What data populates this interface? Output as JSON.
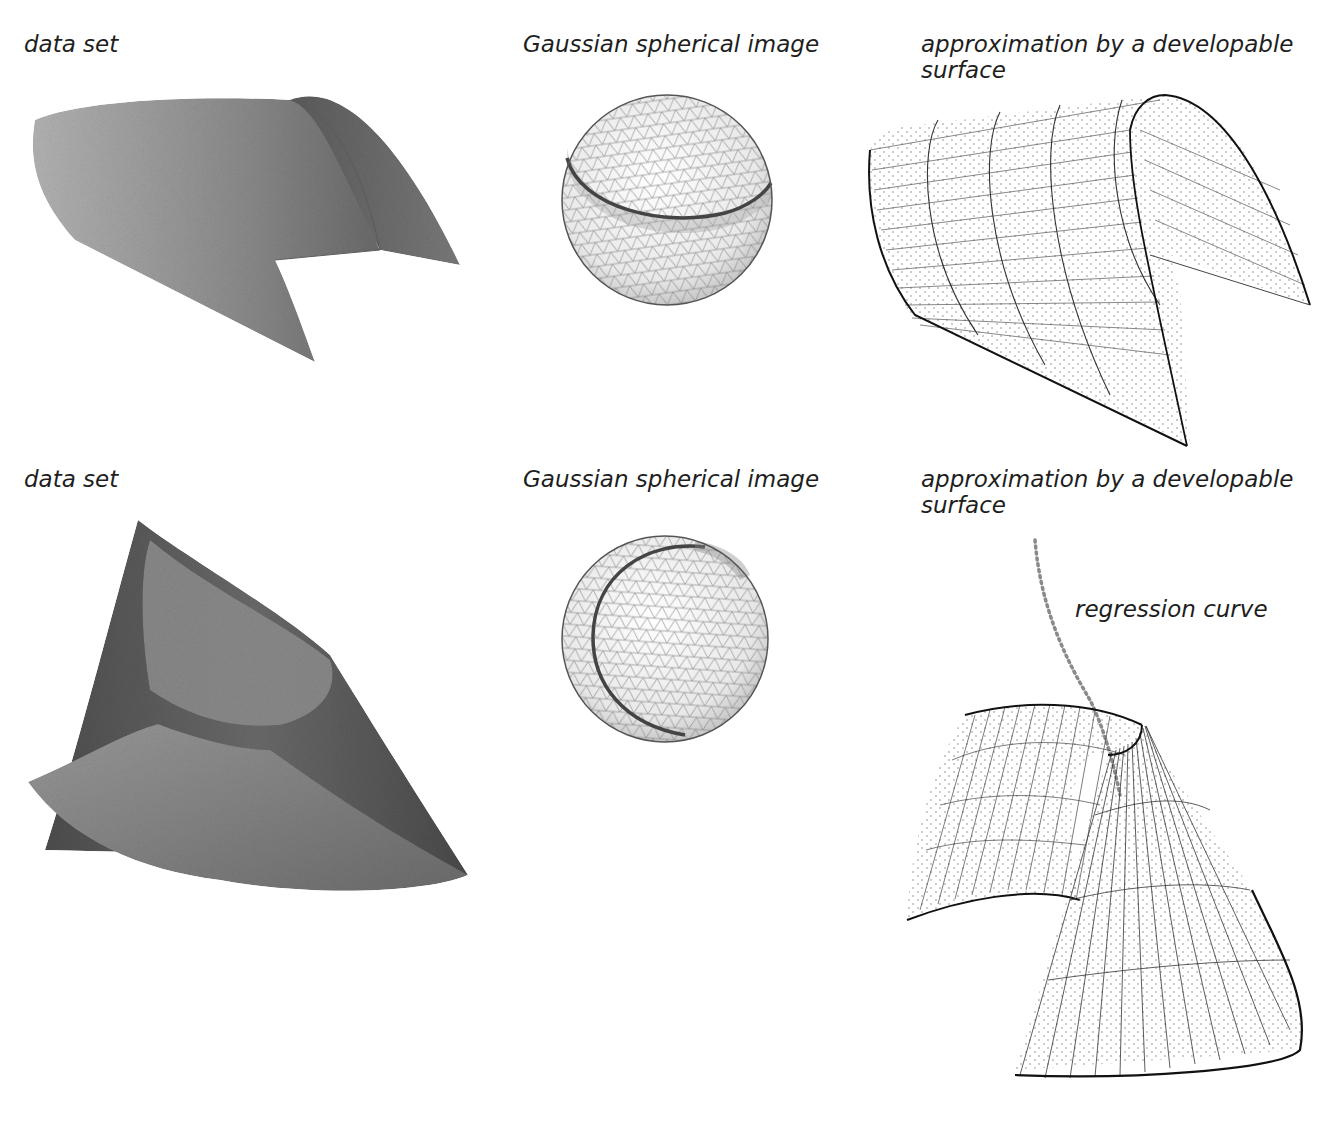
{
  "figure": {
    "rows": [
      {
        "name": "cylinder",
        "panels": [
          {
            "label": "data set",
            "content": "point-cloud-surface"
          },
          {
            "label": "Gaussian spherical image",
            "content": "sphere-with-great-circle"
          },
          {
            "label": "approximation by a developable\nsurface",
            "content": "wireframe-cylinder"
          }
        ]
      },
      {
        "name": "cone",
        "panels": [
          {
            "label": "data set",
            "content": "point-cloud-surface"
          },
          {
            "label": "Gaussian spherical image",
            "content": "sphere-with-small-circle"
          },
          {
            "label": "approximation by a developable\nsurface",
            "content": "wireframe-cone"
          }
        ],
        "annotation": "regression curve"
      }
    ],
    "colors": {
      "surface_light": "#a8a8a8",
      "surface_dark": "#5a5a5a",
      "wire": "#222222",
      "points": "#8a8a8a"
    }
  }
}
